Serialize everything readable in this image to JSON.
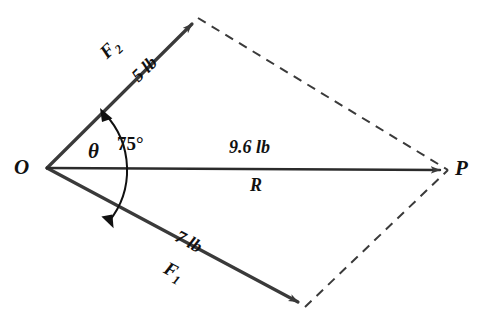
{
  "diagram": {
    "background_color": "#ffffff",
    "stroke_color": "#3a3a3a",
    "text_color": "#111111",
    "vertices": {
      "origin_label": "O",
      "terminus_label": "P"
    },
    "vectors": [
      {
        "name": "F2",
        "label": "F",
        "subscript": "2",
        "magnitude": "5 lb",
        "from": [
          47,
          168
        ],
        "to": [
          198,
          18
        ]
      },
      {
        "name": "F1",
        "label": "F",
        "subscript": "1",
        "magnitude": "7 lb",
        "from": [
          47,
          168
        ],
        "to": [
          305,
          307
        ]
      },
      {
        "name": "R",
        "label": "R",
        "magnitude": "9.6 lb",
        "from": [
          47,
          168
        ],
        "to": [
          448,
          170
        ]
      }
    ],
    "angle": {
      "theta_symbol": "θ",
      "value": "75°",
      "between": [
        "F1",
        "F2"
      ]
    },
    "construction_lines": {
      "style": "dashed",
      "segments": [
        [
          198,
          18,
          448,
          170
        ],
        [
          305,
          307,
          448,
          170
        ]
      ]
    }
  }
}
